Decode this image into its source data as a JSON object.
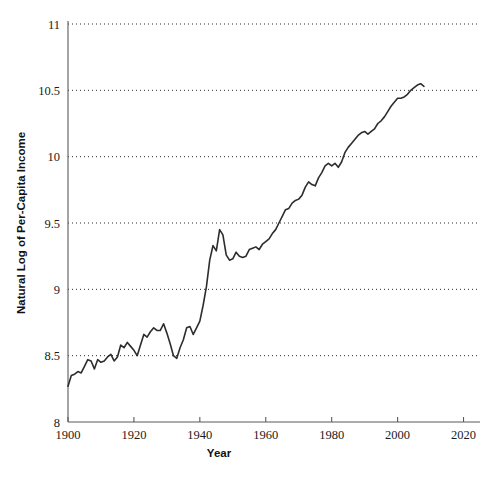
{
  "chart_data": {
    "type": "line",
    "title": "",
    "subtitle": "",
    "xlabel": "Year",
    "ylabel": "Natural Log of Per-Capita Income",
    "xlim": [
      1900,
      2025
    ],
    "ylim": [
      8,
      11
    ],
    "xticks": [
      1900,
      1920,
      1940,
      1960,
      1980,
      2000,
      2020
    ],
    "yticks": [
      8,
      8.5,
      9,
      9.5,
      10,
      10.5,
      11
    ],
    "xtick_labels": [
      "1900",
      "1920",
      "1940",
      "1960",
      "1980",
      "2000",
      "2020"
    ],
    "ytick_labels": [
      "8",
      "8.5",
      "9",
      "9.5",
      "10",
      "10.5",
      "11"
    ],
    "grid": "horizontal-dotted",
    "gridlines_at": [
      8.5,
      9,
      9.5,
      10,
      10.5,
      11
    ],
    "legend": "none",
    "line_color": "#2d2d2d",
    "axis_color": "#5a5a5a",
    "series": [
      {
        "name": "Natural Log of Per-Capita Income",
        "x": [
          1900,
          1901,
          1902,
          1903,
          1904,
          1905,
          1906,
          1907,
          1908,
          1909,
          1910,
          1911,
          1912,
          1913,
          1914,
          1915,
          1916,
          1917,
          1918,
          1919,
          1920,
          1921,
          1922,
          1923,
          1924,
          1925,
          1926,
          1927,
          1928,
          1929,
          1930,
          1931,
          1932,
          1933,
          1934,
          1935,
          1936,
          1937,
          1938,
          1939,
          1940,
          1941,
          1942,
          1943,
          1944,
          1945,
          1946,
          1947,
          1948,
          1949,
          1950,
          1951,
          1952,
          1953,
          1954,
          1955,
          1956,
          1957,
          1958,
          1959,
          1960,
          1961,
          1962,
          1963,
          1964,
          1965,
          1966,
          1967,
          1968,
          1969,
          1970,
          1971,
          1972,
          1973,
          1974,
          1975,
          1976,
          1977,
          1978,
          1979,
          1980,
          1981,
          1982,
          1983,
          1984,
          1985,
          1986,
          1987,
          1988,
          1989,
          1990,
          1991,
          1992,
          1993,
          1994,
          1995,
          1996,
          1997,
          1998,
          1999,
          2000,
          2001,
          2002,
          2003,
          2004,
          2005,
          2006,
          2007,
          2008
        ],
        "values": [
          8.27,
          8.35,
          8.36,
          8.38,
          8.37,
          8.42,
          8.47,
          8.46,
          8.4,
          8.47,
          8.45,
          8.46,
          8.49,
          8.51,
          8.46,
          8.49,
          8.58,
          8.56,
          8.6,
          8.57,
          8.54,
          8.5,
          8.58,
          8.66,
          8.64,
          8.68,
          8.71,
          8.69,
          8.69,
          8.74,
          8.67,
          8.59,
          8.5,
          8.48,
          8.56,
          8.62,
          8.71,
          8.72,
          8.66,
          8.71,
          8.76,
          8.88,
          9.02,
          9.22,
          9.33,
          9.29,
          9.45,
          9.41,
          9.26,
          9.22,
          9.23,
          9.28,
          9.25,
          9.24,
          9.25,
          9.3,
          9.31,
          9.32,
          9.3,
          9.34,
          9.36,
          9.38,
          9.42,
          9.45,
          9.5,
          9.55,
          9.6,
          9.61,
          9.65,
          9.67,
          9.68,
          9.71,
          9.77,
          9.81,
          9.79,
          9.78,
          9.84,
          9.88,
          9.93,
          9.95,
          9.93,
          9.95,
          9.92,
          9.96,
          10.03,
          10.07,
          10.1,
          10.13,
          10.16,
          10.18,
          10.19,
          10.17,
          10.19,
          10.21,
          10.25,
          10.27,
          10.3,
          10.34,
          10.38,
          10.41,
          10.44,
          10.44,
          10.45,
          10.47,
          10.5,
          10.52,
          10.54,
          10.55,
          10.53
        ]
      }
    ]
  },
  "axes": {
    "y_title": "Natural Log of Per-Capita Income",
    "x_title": "Year"
  }
}
